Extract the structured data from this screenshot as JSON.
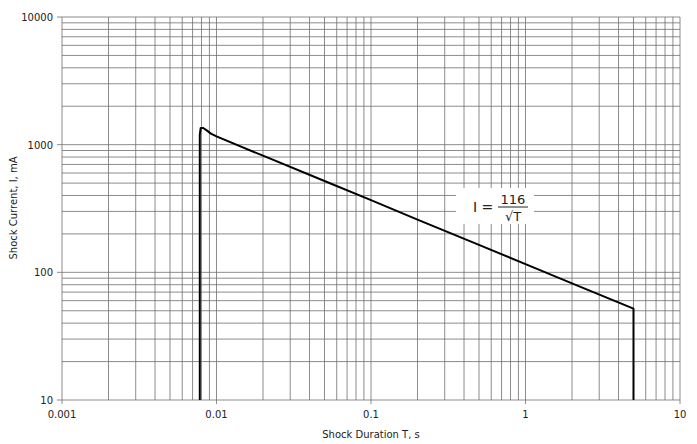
{
  "chart_data": {
    "type": "line",
    "title": "",
    "xlabel": "Shock Duration T, s",
    "ylabel": "Shock Current, I, mA",
    "xscale": "log",
    "yscale": "log",
    "xlim": [
      0.001,
      10
    ],
    "ylim": [
      10,
      10000
    ],
    "x_tick_labels": [
      "0.001",
      "0.01",
      "0.1",
      "1",
      "10"
    ],
    "x_ticks": [
      0.001,
      0.01,
      0.1,
      1,
      10
    ],
    "y_tick_labels": [
      "10",
      "100",
      "1000",
      "10000"
    ],
    "y_ticks": [
      10,
      100,
      1000,
      10000
    ],
    "grid": true,
    "grid_minor": true,
    "legend": null,
    "annotation": {
      "text": "I = 116/√T",
      "lhs": "I =",
      "numerator": "116",
      "denominator": "√T",
      "position_x": 0.95,
      "position_y": 300
    },
    "series": [
      {
        "name": "I = 116/√T",
        "color": "#000000",
        "x": [
          0.0078,
          0.0078,
          0.0079,
          0.0082,
          0.0086,
          0.0092,
          0.01,
          0.02,
          0.05,
          0.1,
          0.2,
          0.5,
          1,
          2,
          5,
          5
        ],
        "y": [
          10,
          1200,
          1350,
          1350,
          1300,
          1220,
          1160,
          820,
          519,
          367,
          259,
          164,
          116,
          82,
          52,
          10
        ]
      }
    ]
  },
  "colors": {
    "background": "#ffffff",
    "grid": "#6e6e6e",
    "curve": "#000000",
    "text": "#222222"
  }
}
